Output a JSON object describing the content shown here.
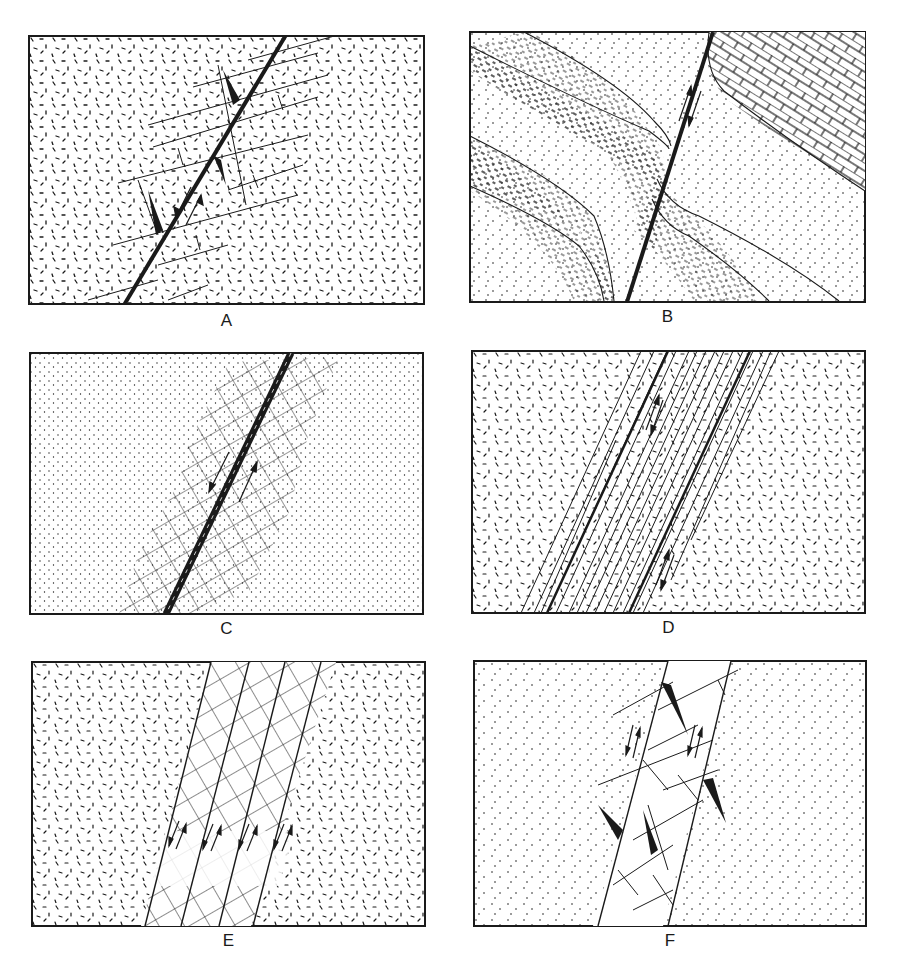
{
  "figure": {
    "panels": [
      {
        "id": "A",
        "label": "A",
        "x": 28,
        "y": 35,
        "w": 397,
        "h": 270,
        "fill_pattern": "dashes"
      },
      {
        "id": "B",
        "label": "B",
        "x": 469,
        "y": 31,
        "w": 397,
        "h": 272,
        "fill_pattern": "dots"
      },
      {
        "id": "C",
        "label": "C",
        "x": 29,
        "y": 352,
        "w": 395,
        "h": 263,
        "fill_pattern": "dense-dots"
      },
      {
        "id": "D",
        "label": "D",
        "x": 471,
        "y": 350,
        "w": 395,
        "h": 264,
        "fill_pattern": "dashes"
      },
      {
        "id": "E",
        "label": "E",
        "x": 31,
        "y": 661,
        "w": 395,
        "h": 266,
        "fill_pattern": "dashes"
      },
      {
        "id": "F",
        "label": "F",
        "x": 473,
        "y": 660,
        "w": 394,
        "h": 267,
        "fill_pattern": "dots"
      }
    ],
    "colors": {
      "ink": "#1a1a1a",
      "paper": "#ffffff"
    }
  }
}
